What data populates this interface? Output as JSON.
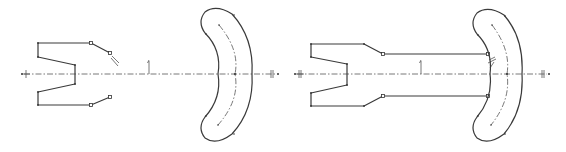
{
  "diagram": {
    "type": "sketch-comparison",
    "panels": [
      {
        "name": "left-sketch",
        "description": "Forked profile with unconnected angled end-points and separate crescent (arc slot) shape on shared centerline",
        "centerline_y": 74,
        "profile_connected_to_crescent": false
      },
      {
        "name": "right-sketch",
        "description": "Forked profile connected by two horizontal lines to the crescent (arc slot) shape on shared centerline",
        "centerline_y": 74,
        "profile_connected_to_crescent": true
      }
    ],
    "colors": {
      "line": "#3a3a3a",
      "centerline": "#555555",
      "background": "#ffffff"
    }
  }
}
